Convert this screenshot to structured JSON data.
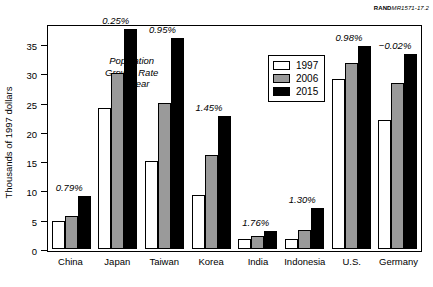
{
  "source_label": {
    "bold": "RAND",
    "italic": "MR1571-17.2"
  },
  "caption": {
    "line1": "Population",
    "line2": "Growth Rate",
    "line3": "per Year"
  },
  "legend": {
    "position": "inside-top-center",
    "entries": [
      {
        "label": "1997",
        "color": "#ffffff"
      },
      {
        "label": "2006",
        "color": "#9a9a9a"
      },
      {
        "label": "2015",
        "color": "#000000"
      }
    ]
  },
  "chart_data": {
    "type": "bar",
    "title": "",
    "xlabel": "",
    "ylabel": "Thousands of 1997 dollars",
    "ylim": [
      0,
      37.5
    ],
    "yticks": [
      0,
      5,
      10,
      15,
      20,
      25,
      30,
      35
    ],
    "ytick_labels": [
      "0",
      "5",
      "10",
      "15",
      "20",
      "25",
      "30",
      "35"
    ],
    "grid": false,
    "categories": [
      "China",
      "Japan",
      "Taiwan",
      "Korea",
      "India",
      "Indonesia",
      "U.S.",
      "Germany"
    ],
    "series": [
      {
        "name": "1997",
        "color": "#ffffff",
        "values": [
          4.7,
          24.0,
          15.0,
          9.3,
          1.7,
          1.7,
          29.0,
          22.0
        ]
      },
      {
        "name": "2006",
        "color": "#9a9a9a",
        "values": [
          5.7,
          30.0,
          25.0,
          16.0,
          2.2,
          3.3,
          31.7,
          28.3
        ]
      },
      {
        "name": "2015",
        "color": "#000000",
        "values": [
          9.0,
          37.5,
          36.0,
          22.7,
          3.0,
          7.0,
          34.7,
          33.3
        ]
      }
    ],
    "annotations": [
      {
        "category": "China",
        "text": "0.79%"
      },
      {
        "category": "Japan",
        "text": "0.25%"
      },
      {
        "category": "Taiwan",
        "text": "0.95%"
      },
      {
        "category": "Korea",
        "text": "1.45%"
      },
      {
        "category": "India",
        "text": "1.76%"
      },
      {
        "category": "Indonesia",
        "text": "1.30%"
      },
      {
        "category": "U.S.",
        "text": "0.98%"
      },
      {
        "category": "Germany",
        "text": "−0.02%"
      }
    ]
  }
}
